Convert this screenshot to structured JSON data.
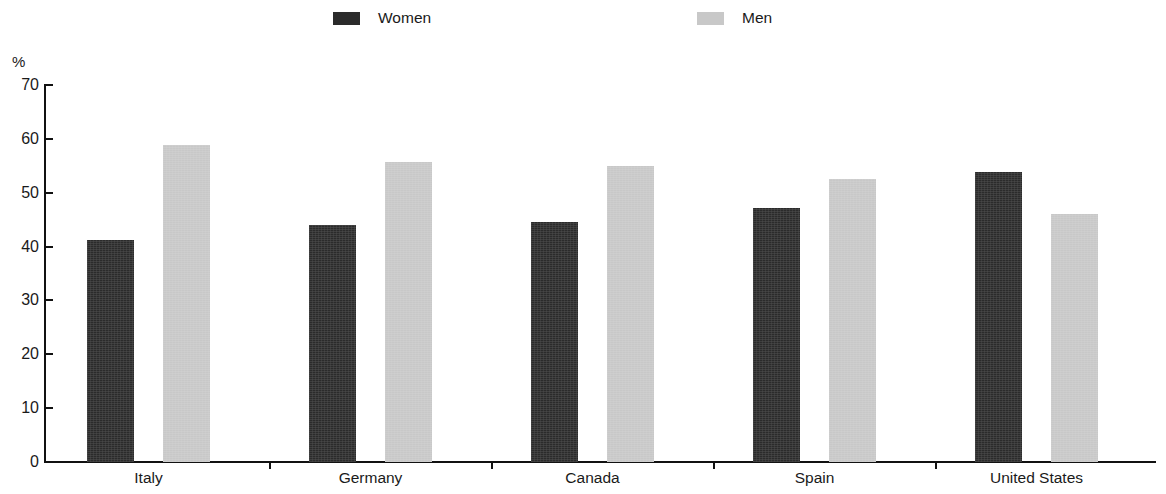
{
  "chart_data": {
    "type": "bar",
    "title": "",
    "subtitle": "",
    "xlabel": "",
    "ylabel": "%",
    "ylim": [
      0,
      70
    ],
    "ytick_step": 10,
    "yticks": [
      "70",
      "60",
      "50",
      "40",
      "30",
      "20",
      "10",
      "0"
    ],
    "grid": false,
    "legend_position": "top-center",
    "categories": [
      "Italy",
      "Germany",
      "Canada",
      "Spain",
      "United States"
    ],
    "series": [
      {
        "name": "Women",
        "color": "#2b2b2b",
        "values": [
          41.2,
          44.0,
          44.6,
          47.2,
          53.8
        ]
      },
      {
        "name": "Men",
        "color": "#c8c8c8",
        "values": [
          58.9,
          55.7,
          55.0,
          52.5,
          46.0
        ]
      }
    ]
  },
  "axis": {
    "unit_label": "%"
  },
  "legend": {
    "entries": [
      {
        "label": "Women",
        "color": "#2b2b2b"
      },
      {
        "label": "Men",
        "color": "#c8c8c8"
      }
    ]
  }
}
